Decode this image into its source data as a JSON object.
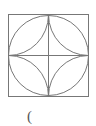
{
  "diagram": {
    "stroke_color": "#777777",
    "square": {
      "x": 8,
      "y": 14,
      "size": 81
    },
    "label": "("
  }
}
